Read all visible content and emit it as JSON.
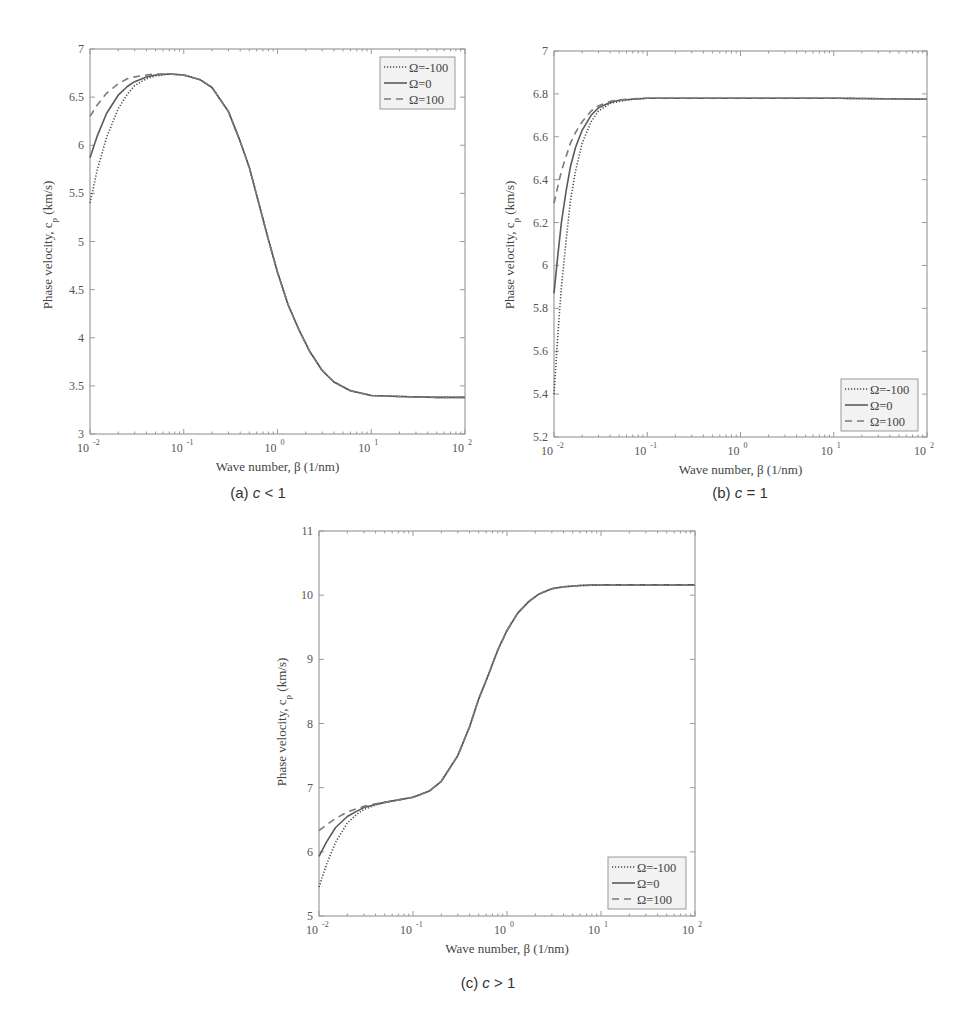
{
  "figure": {
    "panels": [
      "a",
      "b",
      "c"
    ]
  },
  "chart_data": [
    {
      "id": "a",
      "type": "line",
      "caption": "(a) c < 1",
      "caption_parts": {
        "prefix": "(a) ",
        "var": "c",
        "rel": " < 1"
      },
      "xlabel": "Wave number, β (1/nm)",
      "ylabel": "Phase velocity, c_p (km/s)",
      "xscale": "log",
      "xlim": [
        0.01,
        100
      ],
      "ylim": [
        3,
        7
      ],
      "xticks": [
        {
          "base": "10",
          "exp": "-2"
        },
        {
          "base": "10",
          "exp": "-1"
        },
        {
          "base": "10",
          "exp": "0"
        },
        {
          "base": "10",
          "exp": "1"
        },
        {
          "base": "10",
          "exp": "2"
        }
      ],
      "yticks": [
        "3",
        "3.5",
        "4",
        "4.5",
        "5",
        "5.5",
        "6",
        "6.5",
        "7"
      ],
      "ytick_values": [
        3,
        3.5,
        4,
        4.5,
        5,
        5.5,
        6,
        6.5,
        7
      ],
      "legend_position": "upper right",
      "frame": {
        "left": 90,
        "top": 49,
        "right": 465,
        "bottom": 434
      },
      "legend_box": {
        "x": 380,
        "y": 57,
        "w": 75,
        "h": 52
      },
      "caption_pos": {
        "x": 258,
        "y": 498
      },
      "ylabel_pos": {
        "x": 52,
        "y": 245
      },
      "series": [
        {
          "name": "Ω=-100",
          "style": "dotted",
          "x": [
            0.01,
            0.012,
            0.015,
            0.02,
            0.025,
            0.03,
            0.04,
            0.05,
            0.07,
            0.1,
            0.15,
            0.2,
            0.3,
            0.4,
            0.5,
            0.65,
            0.8,
            1.0,
            1.3,
            1.7,
            2.2,
            3.0,
            4.0,
            6.0,
            10,
            20,
            50,
            100
          ],
          "y": [
            5.4,
            5.75,
            6.08,
            6.38,
            6.53,
            6.62,
            6.69,
            6.72,
            6.74,
            6.73,
            6.68,
            6.6,
            6.35,
            6.04,
            5.77,
            5.35,
            5.02,
            4.68,
            4.34,
            4.08,
            3.86,
            3.66,
            3.54,
            3.45,
            3.4,
            3.39,
            3.38,
            3.38
          ]
        },
        {
          "name": "Ω=0",
          "style": "solid",
          "x": [
            0.01,
            0.012,
            0.015,
            0.02,
            0.025,
            0.03,
            0.04,
            0.05,
            0.07,
            0.1,
            0.15,
            0.2,
            0.3,
            0.4,
            0.5,
            0.65,
            0.8,
            1.0,
            1.3,
            1.7,
            2.2,
            3.0,
            4.0,
            6.0,
            10,
            20,
            50,
            100
          ],
          "y": [
            5.87,
            6.1,
            6.33,
            6.52,
            6.61,
            6.66,
            6.71,
            6.73,
            6.74,
            6.73,
            6.68,
            6.6,
            6.35,
            6.04,
            5.77,
            5.35,
            5.02,
            4.68,
            4.34,
            4.08,
            3.86,
            3.66,
            3.54,
            3.45,
            3.4,
            3.39,
            3.38,
            3.38
          ]
        },
        {
          "name": "Ω=100",
          "style": "dashed",
          "x": [
            0.01,
            0.012,
            0.015,
            0.02,
            0.025,
            0.03,
            0.04,
            0.05,
            0.07,
            0.1,
            0.15,
            0.2,
            0.3,
            0.4,
            0.5,
            0.65,
            0.8,
            1.0,
            1.3,
            1.7,
            2.2,
            3.0,
            4.0,
            6.0,
            10,
            20,
            50,
            100
          ],
          "y": [
            6.3,
            6.42,
            6.54,
            6.64,
            6.69,
            6.71,
            6.73,
            6.74,
            6.74,
            6.73,
            6.68,
            6.6,
            6.35,
            6.04,
            5.77,
            5.35,
            5.02,
            4.68,
            4.34,
            4.08,
            3.86,
            3.66,
            3.54,
            3.45,
            3.4,
            3.39,
            3.38,
            3.38
          ]
        }
      ]
    },
    {
      "id": "b",
      "type": "line",
      "caption": "(b) c = 1",
      "caption_parts": {
        "prefix": "(b) ",
        "var": "c",
        "rel": " = 1"
      },
      "xlabel": "Wave number, β (1/nm)",
      "ylabel": "Phase velocity, c_p (km/s)",
      "xscale": "log",
      "xlim": [
        0.01,
        100
      ],
      "ylim": [
        5.2,
        7
      ],
      "xticks": [
        {
          "base": "10",
          "exp": "-2"
        },
        {
          "base": "10",
          "exp": "-1"
        },
        {
          "base": "10",
          "exp": "0"
        },
        {
          "base": "10",
          "exp": "1"
        },
        {
          "base": "10",
          "exp": "2"
        }
      ],
      "yticks": [
        "5.2",
        "5.4",
        "5.6",
        "5.8",
        "6",
        "6.2",
        "6.4",
        "6.6",
        "6.8",
        "7"
      ],
      "ytick_values": [
        5.2,
        5.4,
        5.6,
        5.8,
        6.0,
        6.2,
        6.4,
        6.6,
        6.8,
        7.0
      ],
      "legend_position": "lower right",
      "frame": {
        "left": 554,
        "top": 51,
        "right": 927,
        "bottom": 437
      },
      "legend_box": {
        "x": 841,
        "y": 379,
        "w": 77,
        "h": 52
      },
      "caption_pos": {
        "x": 740,
        "y": 498
      },
      "ylabel_pos": {
        "x": 514,
        "y": 245
      },
      "series": [
        {
          "name": "Ω=-100",
          "style": "dotted",
          "x": [
            0.01,
            0.011,
            0.012,
            0.0135,
            0.015,
            0.017,
            0.02,
            0.025,
            0.03,
            0.04,
            0.05,
            0.07,
            0.1,
            0.2,
            0.5,
            1,
            10,
            100
          ],
          "y": [
            5.4,
            5.68,
            5.9,
            6.12,
            6.3,
            6.44,
            6.57,
            6.67,
            6.72,
            6.755,
            6.765,
            6.775,
            6.78,
            6.78,
            6.78,
            6.78,
            6.78,
            6.775
          ]
        },
        {
          "name": "Ω=0",
          "style": "solid",
          "x": [
            0.01,
            0.011,
            0.012,
            0.0135,
            0.015,
            0.017,
            0.02,
            0.025,
            0.03,
            0.04,
            0.05,
            0.07,
            0.1,
            0.2,
            0.5,
            1,
            10,
            100
          ],
          "y": [
            5.87,
            6.05,
            6.2,
            6.35,
            6.46,
            6.55,
            6.63,
            6.7,
            6.735,
            6.76,
            6.77,
            6.775,
            6.78,
            6.78,
            6.78,
            6.78,
            6.78,
            6.775
          ]
        },
        {
          "name": "Ω=100",
          "style": "dashed",
          "x": [
            0.01,
            0.011,
            0.012,
            0.0135,
            0.015,
            0.017,
            0.02,
            0.025,
            0.03,
            0.04,
            0.05,
            0.07,
            0.1,
            0.2,
            0.5,
            1,
            10,
            100
          ],
          "y": [
            6.29,
            6.37,
            6.44,
            6.51,
            6.57,
            6.62,
            6.67,
            6.72,
            6.745,
            6.765,
            6.772,
            6.777,
            6.78,
            6.78,
            6.78,
            6.78,
            6.78,
            6.775
          ]
        }
      ]
    },
    {
      "id": "c",
      "type": "line",
      "caption": "(c) c > 1",
      "caption_parts": {
        "prefix": "(c) ",
        "var": "c",
        "rel": " > 1"
      },
      "xlabel": "Wave number, β (1/nm)",
      "ylabel": "Phase velocity, c_p (km/s)",
      "xscale": "log",
      "xlim": [
        0.01,
        100
      ],
      "ylim": [
        5,
        11
      ],
      "xticks": [
        {
          "base": "10",
          "exp": "-2"
        },
        {
          "base": "10",
          "exp": "-1"
        },
        {
          "base": "10",
          "exp": "0"
        },
        {
          "base": "10",
          "exp": "1"
        },
        {
          "base": "10",
          "exp": "2"
        }
      ],
      "yticks": [
        "5",
        "6",
        "7",
        "8",
        "9",
        "10",
        "11"
      ],
      "ytick_values": [
        5,
        6,
        7,
        8,
        9,
        10,
        11
      ],
      "legend_position": "lower right",
      "frame": {
        "left": 319,
        "top": 531,
        "right": 695,
        "bottom": 916
      },
      "legend_box": {
        "x": 608,
        "y": 857,
        "w": 78,
        "h": 52
      },
      "caption_pos": {
        "x": 488,
        "y": 988
      },
      "ylabel_pos": {
        "x": 286,
        "y": 722
      },
      "series": [
        {
          "name": "Ω=-100",
          "style": "dotted",
          "x": [
            0.01,
            0.012,
            0.015,
            0.02,
            0.025,
            0.03,
            0.04,
            0.05,
            0.07,
            0.1,
            0.15,
            0.2,
            0.3,
            0.4,
            0.5,
            0.65,
            0.8,
            1.0,
            1.3,
            1.7,
            2.2,
            3.0,
            4.0,
            6.0,
            10,
            20,
            50,
            100
          ],
          "y": [
            5.45,
            5.8,
            6.15,
            6.45,
            6.58,
            6.66,
            6.73,
            6.77,
            6.81,
            6.85,
            6.95,
            7.1,
            7.5,
            7.95,
            8.38,
            8.8,
            9.15,
            9.45,
            9.72,
            9.9,
            10.02,
            10.1,
            10.13,
            10.15,
            10.16,
            10.16,
            10.16,
            10.16
          ]
        },
        {
          "name": "Ω=0",
          "style": "solid",
          "x": [
            0.01,
            0.012,
            0.015,
            0.02,
            0.025,
            0.03,
            0.04,
            0.05,
            0.07,
            0.1,
            0.15,
            0.2,
            0.3,
            0.4,
            0.5,
            0.65,
            0.8,
            1.0,
            1.3,
            1.7,
            2.2,
            3.0,
            4.0,
            6.0,
            10,
            20,
            50,
            100
          ],
          "y": [
            5.93,
            6.15,
            6.38,
            6.55,
            6.63,
            6.69,
            6.74,
            6.77,
            6.81,
            6.85,
            6.95,
            7.1,
            7.5,
            7.95,
            8.38,
            8.8,
            9.15,
            9.45,
            9.72,
            9.9,
            10.02,
            10.1,
            10.13,
            10.15,
            10.16,
            10.16,
            10.16,
            10.16
          ]
        },
        {
          "name": "Ω=100",
          "style": "dashed",
          "x": [
            0.01,
            0.012,
            0.015,
            0.02,
            0.025,
            0.03,
            0.04,
            0.05,
            0.07,
            0.1,
            0.15,
            0.2,
            0.3,
            0.4,
            0.5,
            0.65,
            0.8,
            1.0,
            1.3,
            1.7,
            2.2,
            3.0,
            4.0,
            6.0,
            10,
            20,
            50,
            100
          ],
          "y": [
            6.33,
            6.42,
            6.52,
            6.62,
            6.67,
            6.71,
            6.75,
            6.77,
            6.81,
            6.85,
            6.95,
            7.1,
            7.5,
            7.95,
            8.38,
            8.8,
            9.15,
            9.45,
            9.72,
            9.9,
            10.02,
            10.1,
            10.13,
            10.15,
            10.16,
            10.16,
            10.16,
            10.16
          ]
        }
      ]
    }
  ]
}
